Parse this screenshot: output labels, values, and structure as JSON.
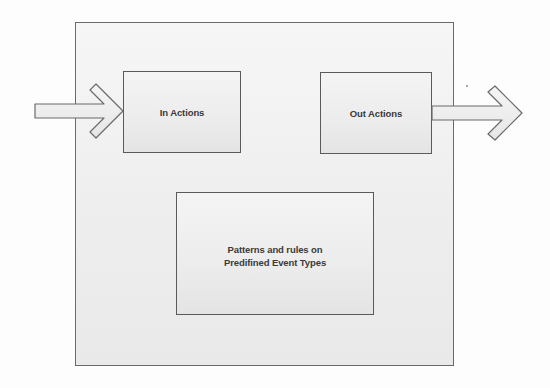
{
  "diagram": {
    "type": "block-diagram",
    "container": {
      "label": ""
    },
    "nodes": [
      {
        "id": "in_actions",
        "lines": [
          "In Actions"
        ]
      },
      {
        "id": "out_actions",
        "lines": [
          "Out Actions"
        ]
      },
      {
        "id": "patterns",
        "lines": [
          "Patterns and rules on",
          "Predifined Event Types"
        ]
      }
    ],
    "edges": [
      {
        "from": "external_input",
        "to": "in_actions",
        "style": "block-arrow",
        "direction": "right"
      },
      {
        "from": "out_actions",
        "to": "external_output",
        "style": "block-arrow",
        "direction": "right"
      }
    ],
    "colors": {
      "stroke": "#5a5a5a",
      "fill": "#eeeeee",
      "text": "#3a3a3a",
      "background": "#ffffff"
    }
  }
}
